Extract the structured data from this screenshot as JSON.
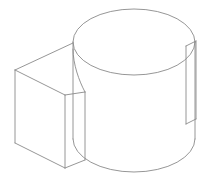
{
  "image": {
    "title": "Isometric technical line drawing",
    "subject": "Cylinder with rectangular block boss and thin rectangular tab",
    "background_color": "#ffffff",
    "line_color": "#8a8a8a",
    "fill_color": "#ffffff",
    "line_width": 0.9,
    "width": 211,
    "height": 181
  },
  "geometry": {
    "cylinder": {
      "name": "main-cylinder",
      "top_ellipse": {
        "center_x": 134,
        "center_y": 42,
        "radius_x": 61,
        "radius_y": 33
      },
      "left_silhouette_x": 73,
      "right_silhouette_x": 195,
      "top_y": 42,
      "bottom_center_y": 139,
      "bottom_ellipse_radius_y": 33,
      "body_height": 97
    },
    "block": {
      "name": "left-rectangular-block",
      "top_back_left": [
        15,
        70
      ],
      "top_back_right": [
        73,
        43
      ],
      "top_front_left": [
        15,
        70
      ],
      "front_top_left": [
        15,
        70
      ],
      "front_top_apex": [
        65,
        95
      ],
      "front_top_right": [
        85,
        92
      ],
      "front_bottom_left": [
        15,
        143
      ],
      "front_bottom_apex": [
        65,
        168
      ],
      "front_bottom_right": [
        85,
        160
      ],
      "left_edge_x": 15,
      "apex_edge_x": 65,
      "right_edge_x": 85
    },
    "tab": {
      "name": "right-rectangular-tab",
      "top_left": [
        186,
        46
      ],
      "top_right": [
        196,
        41
      ],
      "bottom_left": [
        186,
        124
      ],
      "bottom_right": [
        196,
        119
      ],
      "width": 10,
      "height": 78
    }
  },
  "annotations": {
    "visible_text": "",
    "labels": [],
    "dimensions": []
  }
}
